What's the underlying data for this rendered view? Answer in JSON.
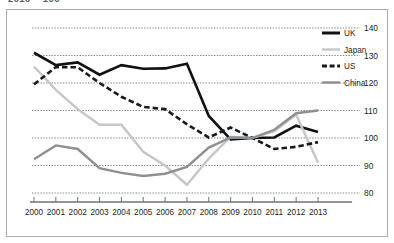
{
  "caption": "2010 = 100",
  "chart_data": {
    "type": "line",
    "title": "",
    "subtitle": "",
    "xlabel": "",
    "ylabel": "",
    "categories": [
      "2000",
      "2001",
      "2002",
      "2003",
      "2004",
      "2005",
      "2006",
      "2007",
      "2008",
      "2009",
      "2010",
      "2011",
      "2012",
      "2013"
    ],
    "x": [
      2000,
      2001,
      2002,
      2003,
      2004,
      2005,
      2006,
      2007,
      2008,
      2009,
      2010,
      2011,
      2012,
      2013
    ],
    "ylim": [
      80,
      140
    ],
    "yticks": [
      80,
      90,
      100,
      110,
      120,
      130,
      140
    ],
    "ytick_labels": [
      "80",
      "90",
      "100",
      "110",
      "120",
      "130",
      "140"
    ],
    "grid": true,
    "grid_style": "dotted-horizontal",
    "legend_position": "top-right",
    "series": [
      {
        "name": "UK",
        "color": "#111111",
        "style": "solid",
        "width": 2.6,
        "values": [
          131.0,
          126.5,
          127.5,
          123.0,
          126.5,
          125.2,
          125.3,
          127.0,
          108.0,
          99.5,
          100.0,
          100.2,
          104.5,
          102.2
        ]
      },
      {
        "name": "Japan",
        "color": "#c4c6c8",
        "style": "solid",
        "width": 2.4,
        "values": [
          126.0,
          117.5,
          110.5,
          104.8,
          104.8,
          95.0,
          90.0,
          83.0,
          92.5,
          100.5,
          100.0,
          102.5,
          108.5,
          91.0
        ]
      },
      {
        "name": "US",
        "color": "#1a1a1a",
        "style": "dashed",
        "width": 2.6,
        "values": [
          119.5,
          125.8,
          125.7,
          120.0,
          115.0,
          111.3,
          110.5,
          105.0,
          100.2,
          103.8,
          100.0,
          96.0,
          96.8,
          98.5
        ]
      },
      {
        "name": "China",
        "color": "#8d9093",
        "style": "solid",
        "width": 2.4,
        "values": [
          92.3,
          97.3,
          96.0,
          89.0,
          87.3,
          86.2,
          87.0,
          89.5,
          96.5,
          100.2,
          100.0,
          103.0,
          109.0,
          110.0
        ]
      }
    ],
    "legend": [
      {
        "label": "UK",
        "color": "#111111",
        "style": "solid"
      },
      {
        "label": "Japan",
        "color": "#c4c6c8",
        "style": "solid"
      },
      {
        "label": "US",
        "color": "#1a1a1a",
        "style": "dashed"
      },
      {
        "label": "China",
        "color": "#8d9093",
        "style": "solid"
      }
    ]
  }
}
